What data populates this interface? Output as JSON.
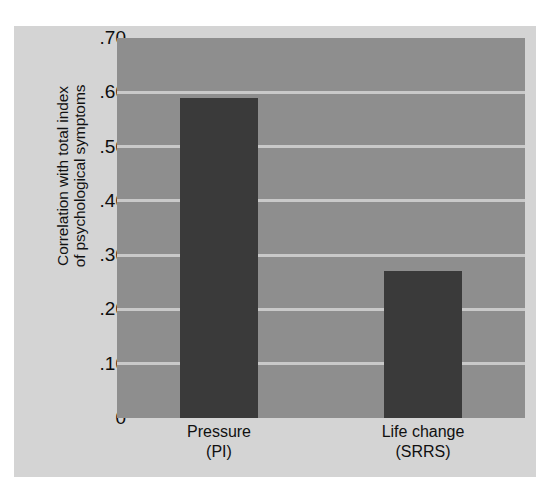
{
  "chart_data": {
    "type": "bar",
    "title": "",
    "subtitle": "",
    "xlabel": "",
    "ylabel_lines": [
      "Correlation with total index",
      "of psychological symptoms"
    ],
    "ylabel": "Correlation with total index of psychological symptoms",
    "categories": [
      "Pressure",
      "Life change"
    ],
    "category_sublabels": [
      "(PI)",
      "(SRRS)"
    ],
    "values": [
      0.59,
      0.27
    ],
    "ylim": [
      0,
      0.7
    ],
    "ytick_values": [
      0.7,
      0.6,
      0.5,
      0.4,
      0.3,
      0.2,
      0.1,
      0
    ],
    "ytick_labels": [
      ".70",
      ".60",
      ".50",
      ".40",
      ".30",
      ".20",
      ".10",
      "0"
    ],
    "grid": true,
    "grid_axis": "y",
    "legend": false,
    "legend_position": "none",
    "colors": {
      "bar": "#3a3a3a",
      "plot_background": "#8e8e8e",
      "gridline": "#c9c9c9",
      "figure_background": "#d4d4d4",
      "page_background": "#ffffff",
      "text": "#101010"
    }
  }
}
